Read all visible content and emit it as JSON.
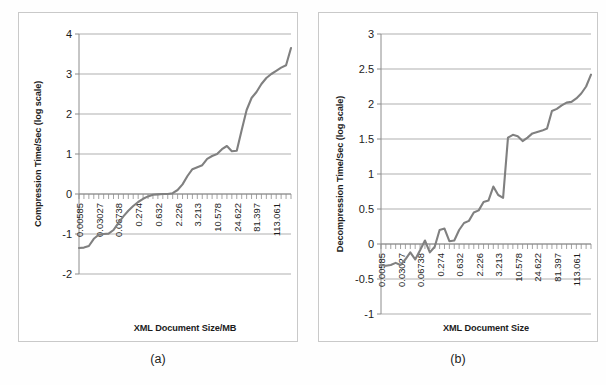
{
  "figure": {
    "panels": [
      {
        "id": "a",
        "caption": "(a)",
        "ylabel": "Compression Time/Sec (log scale)",
        "xlabel": "XML Document Size/MB"
      },
      {
        "id": "b",
        "caption": "(b)",
        "ylabel": "Decompression Time/Sec (log scale)",
        "xlabel": "XML Document Size"
      }
    ]
  },
  "colors": {
    "series": "#808080",
    "gridline": "#a6a6a6",
    "axis": "#8c8c8c",
    "panel_border": "#c9c9c9",
    "text": "#1c1c1c",
    "background": "#ffffff"
  },
  "chart_data": [
    {
      "type": "line",
      "title": "",
      "subcaption": "(a)",
      "xlabel": "XML Document Size/MB",
      "ylabel": "Compression Time/Sec (log scale)",
      "grid": true,
      "legend": null,
      "ylim": [
        -2,
        4
      ],
      "yticks": [
        -2,
        -1,
        0,
        1,
        2,
        3,
        4
      ],
      "ytick_labels": [
        "-2",
        "-1",
        "0",
        "1",
        "2",
        "3",
        "4"
      ],
      "xtick_labels": [
        "0.00585",
        "0.03027",
        "0.06738",
        "0.274",
        "0.632",
        "2.226",
        "3.213",
        "10.578",
        "24.622",
        "81.397",
        "113.061"
      ],
      "xtick_positions": [
        0,
        4,
        8,
        12,
        16,
        20,
        24,
        28,
        32,
        36,
        40
      ],
      "x_minor_ticks": 44,
      "x": [
        0,
        1,
        2,
        3,
        4,
        5,
        6,
        7,
        8,
        9,
        10,
        11,
        12,
        13,
        14,
        15,
        16,
        17,
        18,
        19,
        20,
        21,
        22,
        23,
        24,
        25,
        26,
        27,
        28,
        29,
        30,
        31,
        32,
        33,
        34,
        35,
        36,
        37,
        38,
        39,
        40,
        41,
        42,
        43
      ],
      "values": [
        -1.35,
        -1.34,
        -1.3,
        -1.12,
        -1.02,
        -1.0,
        -0.99,
        -0.9,
        -0.72,
        -0.56,
        -0.42,
        -0.3,
        -0.2,
        -0.12,
        -0.06,
        -0.02,
        -0.01,
        0.0,
        0.0,
        0.02,
        0.1,
        0.24,
        0.45,
        0.62,
        0.67,
        0.72,
        0.88,
        0.95,
        1.0,
        1.12,
        1.2,
        1.07,
        1.08,
        1.6,
        2.1,
        2.4,
        2.55,
        2.75,
        2.9,
        3.0,
        3.08,
        3.16,
        3.22,
        3.65
      ]
    },
    {
      "type": "line",
      "title": "",
      "subcaption": "(b)",
      "xlabel": "XML Document Size",
      "ylabel": "Decompression Time/Sec (log scale)",
      "grid": true,
      "legend": null,
      "ylim": [
        -1,
        3
      ],
      "yticks": [
        -1,
        -0.5,
        0,
        0.5,
        1,
        1.5,
        2,
        2.5,
        3
      ],
      "ytick_labels": [
        "-1",
        "-0.5",
        "0",
        "0.5",
        "1",
        "1.5",
        "2",
        "2.5",
        "3"
      ],
      "xtick_labels": [
        "0.00585",
        "0.03027",
        "0.06738",
        "0.274",
        "0.632",
        "2.226",
        "3.213",
        "10.578",
        "24.622",
        "81.397",
        "113.061"
      ],
      "xtick_positions": [
        0,
        4,
        8,
        12,
        16,
        20,
        24,
        28,
        32,
        36,
        40
      ],
      "x_minor_ticks": 44,
      "x": [
        0,
        1,
        2,
        3,
        4,
        5,
        6,
        7,
        8,
        9,
        10,
        11,
        12,
        13,
        14,
        15,
        16,
        17,
        18,
        19,
        20,
        21,
        22,
        23,
        24,
        25,
        26,
        27,
        28,
        29,
        30,
        31,
        32,
        33,
        34,
        35,
        36,
        37,
        38,
        39,
        40,
        41,
        42,
        43
      ],
      "values": [
        -0.3,
        -0.31,
        -0.3,
        -0.27,
        -0.3,
        -0.22,
        -0.12,
        -0.22,
        -0.09,
        0.05,
        -0.12,
        -0.04,
        0.2,
        0.22,
        0.04,
        0.05,
        0.2,
        0.3,
        0.33,
        0.45,
        0.48,
        0.6,
        0.62,
        0.82,
        0.7,
        0.66,
        1.52,
        1.56,
        1.54,
        1.47,
        1.52,
        1.58,
        1.6,
        1.62,
        1.65,
        1.9,
        1.93,
        1.98,
        2.02,
        2.03,
        2.08,
        2.15,
        2.25,
        2.42
      ]
    }
  ]
}
